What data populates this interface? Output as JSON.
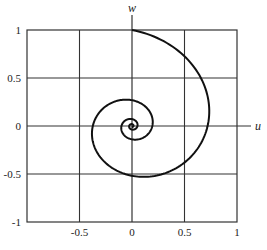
{
  "chart_data": {
    "type": "line",
    "title": "",
    "xlabel": "u",
    "ylabel": "w",
    "xlim": [
      -1,
      1
    ],
    "ylim": [
      -1,
      1
    ],
    "grid": true,
    "legend": null,
    "x_ticks": [
      {
        "value": -0.5,
        "label": "-0.5"
      },
      {
        "value": 0,
        "label": "0"
      },
      {
        "value": 0.5,
        "label": "0.5"
      },
      {
        "value": 1,
        "label": "1"
      }
    ],
    "y_ticks": [
      {
        "value": 1,
        "label": "1"
      },
      {
        "value": 0.5,
        "label": "0.5"
      },
      {
        "value": 0,
        "label": "0"
      },
      {
        "value": -0.5,
        "label": "-0.5"
      },
      {
        "value": -1,
        "label": "-1"
      }
    ],
    "series": [
      {
        "name": "spiral",
        "description": "Clockwise logarithmic spiral starting at (0,1), shrinking ~0.72 per quarter turn toward the origin",
        "key_points": [
          {
            "u": 0,
            "w": 1
          },
          {
            "u": 0.72,
            "w": 0
          },
          {
            "u": 0,
            "w": -0.52
          },
          {
            "u": -0.37,
            "w": 0
          },
          {
            "u": 0,
            "w": 0.27
          },
          {
            "u": 0.19,
            "w": 0
          },
          {
            "u": 0,
            "w": -0.14
          },
          {
            "u": -0.1,
            "w": 0
          },
          {
            "u": 0,
            "w": 0.07
          },
          {
            "u": 0.05,
            "w": 0
          }
        ],
        "decay_per_quarter_turn": 0.72,
        "turns": 3.5
      }
    ]
  },
  "labels": {
    "x_axis": "u",
    "y_axis": "w"
  },
  "colors": {
    "curve": "#111111",
    "grid": "#333333",
    "background": "#ffffff"
  }
}
